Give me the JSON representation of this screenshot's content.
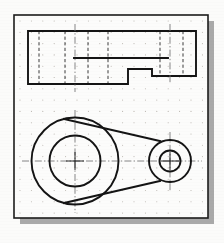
{
  "document": {
    "kind": "technical-drawing",
    "title": "Orthographic drawing of crank arm / link",
    "medium": "dotted grid drafting paper",
    "view_count": 2,
    "projection": "third-angle two-view"
  },
  "page": {
    "background_color": "#fbfbfa",
    "sheet_color": "#fcfcfb",
    "sheet_border_color": "#1c1c1c",
    "sheet_border_width": 1.6,
    "shadow_color": "#8e8e8e",
    "shadow_offset_x": 6,
    "shadow_offset_y": 6,
    "sheet": {
      "x": 14,
      "y": 15,
      "width": 194,
      "height": 203
    }
  },
  "grid": {
    "dot_color": "#b9b4ae",
    "dot_radius": 0.55,
    "spacing_x": 11.4,
    "spacing_y": 11.3,
    "origin_x": 20,
    "origin_y": 21,
    "columns": 17,
    "rows": 18,
    "visible": true
  },
  "line_styles": {
    "visible_color": "#141414",
    "visible_width": 1.9,
    "hidden_color": "#3a3a3a",
    "hidden_width": 1.0,
    "hidden_dash": "3.2 2.4",
    "center_color": "#737373",
    "center_width": 0.85,
    "center_dash": "7 2.2 1.4 2.2"
  },
  "views": [
    {
      "name": "front-view",
      "label": "Front view (stepped profile, elevation)",
      "outline": [
        [
          28,
          31
        ],
        [
          196,
          31
        ],
        [
          196,
          76
        ],
        [
          152,
          76
        ],
        [
          152,
          69
        ],
        [
          128,
          69
        ],
        [
          128,
          84
        ],
        [
          28,
          84
        ]
      ],
      "step_shoulder": {
        "x1": 74,
        "y1": 58,
        "x2": 168,
        "y2": 58
      },
      "hidden_lines": [
        {
          "name": "hidden-bore-left-a",
          "x": 39,
          "y1": 31,
          "y2": 84
        },
        {
          "name": "hidden-bore-left-b",
          "x": 65,
          "y1": 31,
          "y2": 84
        },
        {
          "name": "hidden-hub-left-a",
          "x": 88,
          "y1": 31,
          "y2": 84
        },
        {
          "name": "hidden-hub-left-b",
          "x": 108,
          "y1": 31,
          "y2": 84
        },
        {
          "name": "hidden-bore-right-a",
          "x": 160,
          "y1": 31,
          "y2": 76
        },
        {
          "name": "hidden-bore-right-b",
          "x": 183,
          "y1": 31,
          "y2": 76
        }
      ],
      "center_lines": [
        {
          "name": "center-large-hub",
          "x": 75,
          "y1": 24,
          "y2": 92
        },
        {
          "name": "center-small-hub",
          "x": 170,
          "y1": 24,
          "y2": 83
        }
      ]
    },
    {
      "name": "plan-view",
      "label": "Plan view (two hubs joined by tangent web)",
      "large_hub": {
        "name": "large-hub",
        "cx": 75,
        "cy": 161,
        "outer_r": 43.5,
        "inner_r": 25.5
      },
      "small_hub": {
        "name": "small-hub",
        "cx": 170,
        "cy": 161,
        "outer_r": 21.0,
        "inner_r": 10.5
      },
      "tangent_lines": [
        {
          "name": "web-upper-tangent",
          "x1": 64,
          "y1": 119,
          "x2": 160,
          "y2": 141
        },
        {
          "name": "web-lower-tangent",
          "x1": 64,
          "y1": 203,
          "x2": 160,
          "y2": 181
        }
      ],
      "center_lines": {
        "horizontal": {
          "x1": 22,
          "y1": 161,
          "x2": 202,
          "y2": 161
        },
        "vertical_large": {
          "x": 75,
          "y1": 110,
          "y2": 213
        },
        "vertical_small": {
          "x": 170,
          "y1": 132,
          "y2": 191
        }
      },
      "center_cross_small": {
        "half_len": 9
      }
    }
  ]
}
